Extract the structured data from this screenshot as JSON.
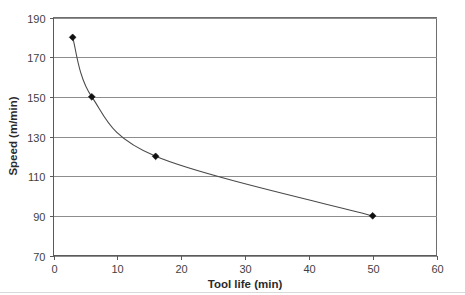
{
  "chart_data": {
    "type": "line",
    "title": "",
    "xlabel": "Tool life (min)",
    "ylabel": "Speed (m/min)",
    "xlim": [
      0,
      60
    ],
    "ylim": [
      70,
      190
    ],
    "xticks": [
      0,
      10,
      20,
      30,
      40,
      50,
      60
    ],
    "yticks": [
      70,
      90,
      110,
      130,
      150,
      170,
      190
    ],
    "xtick_labels": [
      "0",
      "10",
      "20",
      "30",
      "40",
      "50",
      "60"
    ],
    "ytick_labels": [
      "70",
      "90",
      "110",
      "130",
      "150",
      "170",
      "190"
    ],
    "grid": "horizontal",
    "legend": "none",
    "marker": "diamond",
    "line_color": "#4a4a4a",
    "marker_color": "#111111",
    "grid_color": "#8d8d8d",
    "background": "#ffffff",
    "series": [
      {
        "name": "Taylor tool life curve",
        "x": [
          3,
          6,
          16,
          50
        ],
        "y": [
          180,
          150,
          120,
          90
        ],
        "points": [
          {
            "x": 3,
            "y": 180
          },
          {
            "x": 6,
            "y": 150
          },
          {
            "x": 16,
            "y": 120
          },
          {
            "x": 50,
            "y": 90
          }
        ]
      }
    ]
  },
  "axis": {
    "x_title": "Tool life (min)",
    "y_title": "Speed (m/min)"
  }
}
